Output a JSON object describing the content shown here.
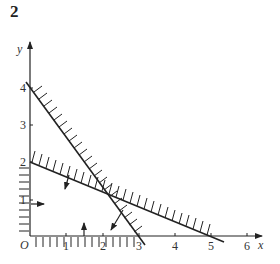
{
  "question_number": "2",
  "axes": {
    "x_label": "x",
    "y_label": "y",
    "origin_label": "O",
    "x_ticks": [
      "1",
      "2",
      "3",
      "4",
      "5",
      "6"
    ],
    "y_ticks": [
      "1",
      "2",
      "3",
      "4"
    ]
  },
  "lines": [
    {
      "name": "4x + 3y = 12",
      "x_intercept": 3,
      "y_intercept": 4,
      "shaded_side": "above"
    },
    {
      "name": "2x + 5y = 10",
      "x_intercept": 5,
      "y_intercept": 2,
      "shaded_side": "above"
    },
    {
      "name": "x = 0",
      "shaded_side": "left"
    },
    {
      "name": "y = 0",
      "shaded_side": "below"
    }
  ],
  "colors": {
    "ink": "#222222",
    "background": "#ffffff"
  }
}
